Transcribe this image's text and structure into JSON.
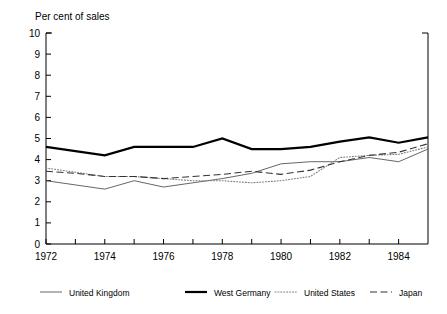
{
  "chart_data": {
    "type": "line",
    "title": "Per cent of sales",
    "xlabel": "",
    "ylabel": "",
    "ylim": [
      0,
      10
    ],
    "xlim": [
      1972,
      1985
    ],
    "grid": false,
    "legend_position": "bottom",
    "y_ticks": [
      "0",
      "1",
      "2",
      "3",
      "4",
      "5",
      "6",
      "7",
      "8",
      "9",
      "10"
    ],
    "x_ticks": [
      "1972",
      "1974",
      "1976",
      "1978",
      "1980",
      "1982",
      "1984"
    ],
    "x_tick_values": [
      1972,
      1974,
      1976,
      1978,
      1980,
      1982,
      1984
    ],
    "x_minor_values": [
      1973,
      1975,
      1977,
      1979,
      1981,
      1983,
      1985
    ],
    "x": [
      1972,
      1973,
      1974,
      1975,
      1976,
      1977,
      1978,
      1979,
      1980,
      1981,
      1982,
      1983,
      1984,
      1985
    ],
    "series": [
      {
        "name": "United Kingdom",
        "style": "solid-thin",
        "color": "#555555",
        "width": 0.9,
        "values": [
          3.0,
          2.8,
          2.6,
          3.0,
          2.7,
          2.9,
          3.1,
          3.35,
          3.8,
          3.9,
          3.9,
          4.1,
          3.9,
          4.5
        ]
      },
      {
        "name": "West Germany",
        "style": "solid-thick",
        "color": "#000000",
        "width": 2.2,
        "values": [
          4.6,
          4.4,
          4.2,
          4.6,
          4.6,
          4.6,
          5.0,
          4.5,
          4.5,
          4.6,
          4.85,
          5.05,
          4.8,
          5.05
        ]
      },
      {
        "name": "United States",
        "style": "dotted",
        "color": "#808080",
        "width": 1.1,
        "values": [
          3.6,
          3.4,
          3.2,
          3.2,
          3.1,
          3.0,
          3.0,
          2.9,
          3.0,
          3.2,
          4.1,
          4.2,
          4.25,
          4.6
        ]
      },
      {
        "name": "Japan",
        "style": "dashed",
        "color": "#333333",
        "width": 1.1,
        "values": [
          3.45,
          3.35,
          3.2,
          3.2,
          3.1,
          3.2,
          3.3,
          3.45,
          3.3,
          3.5,
          3.9,
          4.2,
          4.35,
          4.75
        ]
      }
    ]
  },
  "legend": {
    "items": [
      {
        "label": "United Kingdom",
        "swatch": "solid-thin-swatch"
      },
      {
        "label": "West Germany",
        "swatch": "solid-thick-swatch"
      },
      {
        "label": "United States",
        "swatch": "dotted-swatch"
      },
      {
        "label": "Japan",
        "swatch": "dashed-swatch"
      }
    ]
  }
}
